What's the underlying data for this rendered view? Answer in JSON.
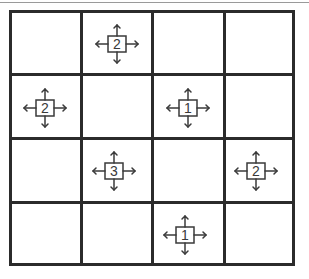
{
  "puzzle": {
    "rows": 4,
    "cols": 4,
    "colors": {
      "line": "#2b2b2b",
      "clue": "#3a3a3a",
      "background": "#ffffff"
    },
    "clues": [
      {
        "row": 0,
        "col": 1,
        "value": "2",
        "arrows": [
          "up",
          "down",
          "left",
          "right"
        ]
      },
      {
        "row": 1,
        "col": 0,
        "value": "2",
        "arrows": [
          "up",
          "down",
          "left",
          "right"
        ]
      },
      {
        "row": 1,
        "col": 2,
        "value": "1",
        "arrows": [
          "up",
          "down",
          "left",
          "right"
        ]
      },
      {
        "row": 2,
        "col": 1,
        "value": "3",
        "arrows": [
          "up",
          "down",
          "left",
          "right"
        ]
      },
      {
        "row": 2,
        "col": 3,
        "value": "2",
        "arrows": [
          "up",
          "down",
          "left",
          "right"
        ]
      },
      {
        "row": 3,
        "col": 2,
        "value": "1",
        "arrows": [
          "up",
          "down",
          "left",
          "right"
        ]
      }
    ]
  }
}
